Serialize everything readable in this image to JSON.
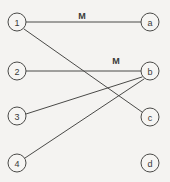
{
  "diagram": {
    "type": "bipartite-matching-graph",
    "background_color": "#f4f3f1",
    "stroke_color": "#4a4a48",
    "node_fill_color": "#f6f5f3",
    "node_radius": 9,
    "left_nodes": [
      {
        "id": "1",
        "label": "1",
        "cx": 17,
        "cy": 22
      },
      {
        "id": "2",
        "label": "2",
        "cx": 17,
        "cy": 71
      },
      {
        "id": "3",
        "label": "3",
        "cx": 17,
        "cy": 116
      },
      {
        "id": "4",
        "label": "4",
        "cx": 17,
        "cy": 163
      }
    ],
    "right_nodes": [
      {
        "id": "a",
        "label": "a",
        "cx": 150,
        "cy": 22
      },
      {
        "id": "b",
        "label": "b",
        "cx": 150,
        "cy": 71
      },
      {
        "id": "c",
        "label": "c",
        "cx": 150,
        "cy": 117
      },
      {
        "id": "d",
        "label": "d",
        "cx": 150,
        "cy": 163
      }
    ],
    "edges": [
      {
        "id": "edge-1-a",
        "from": "1",
        "to": "a",
        "x1": 26,
        "y1": 22,
        "x2": 141,
        "y2": 22,
        "matched": true
      },
      {
        "id": "edge-1-c",
        "from": "1",
        "to": "c",
        "x1": 24,
        "y1": 29,
        "x2": 142,
        "y2": 112,
        "matched": false
      },
      {
        "id": "edge-2-b",
        "from": "2",
        "to": "b",
        "x1": 26,
        "y1": 71,
        "x2": 141,
        "y2": 71,
        "matched": true
      },
      {
        "id": "edge-3-b",
        "from": "3",
        "to": "b",
        "x1": 26,
        "y1": 114,
        "x2": 142,
        "y2": 77,
        "matched": false
      },
      {
        "id": "edge-4-b",
        "from": "4",
        "to": "b",
        "x1": 25,
        "y1": 158,
        "x2": 144,
        "y2": 79,
        "matched": false
      }
    ],
    "edge_labels": [
      {
        "id": "label-m-top",
        "text": "M",
        "x": 82,
        "y": 16
      },
      {
        "id": "label-m-middle",
        "text": "M",
        "x": 116,
        "y": 61
      }
    ]
  }
}
